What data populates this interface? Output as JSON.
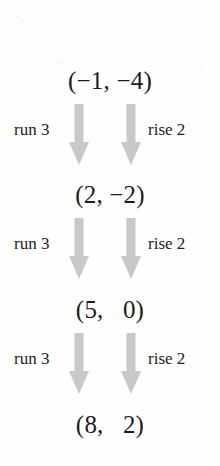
{
  "figure": {
    "arrow_color": "#c8c8c8",
    "text_color": "#1c1c1c",
    "background_color": "#ffffff"
  },
  "coordinates": [
    {
      "text": "(−1, −4)"
    },
    {
      "text": "(2, −2)"
    },
    {
      "text": "(5,   0)"
    },
    {
      "text": "(8,   2)"
    }
  ],
  "steps": [
    {
      "run_label": "run 3",
      "rise_label": "rise 2"
    },
    {
      "run_label": "run 3",
      "rise_label": "rise 2"
    },
    {
      "run_label": "run 3",
      "rise_label": "rise 2"
    }
  ]
}
